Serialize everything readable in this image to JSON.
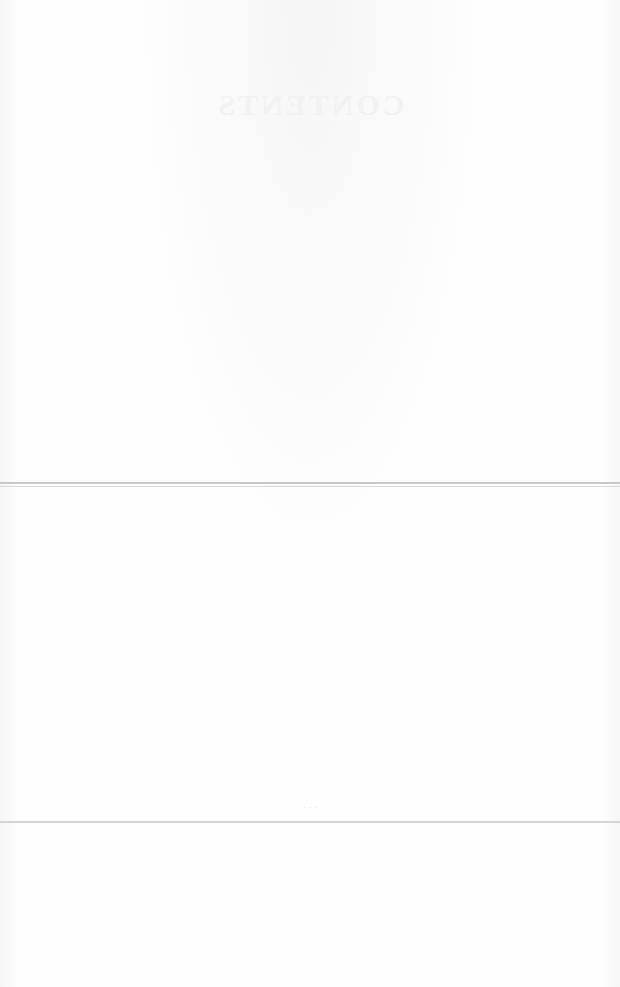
{
  "document": {
    "type": "scanned blank page with reverse-side bleed-through",
    "bleed_through_title": "CONTENTS",
    "page_mark": "· · ·",
    "colors": {
      "paper": "#fdfdfd",
      "rule_double": "#c9c9c9",
      "rule_single": "#d4d4d4"
    }
  }
}
